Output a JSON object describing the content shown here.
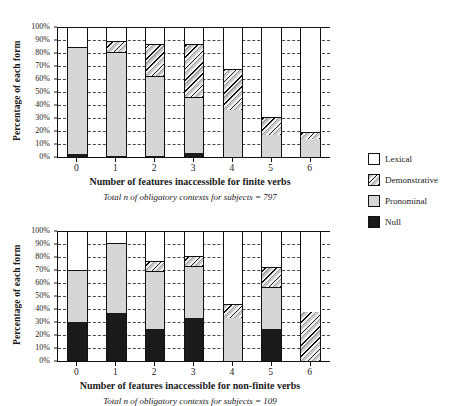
{
  "legend": {
    "items": [
      {
        "label": "Lexical",
        "key": "lexical",
        "color": "#ffffff"
      },
      {
        "label": "Demonstrative",
        "key": "demonstrative",
        "color": "#hatch"
      },
      {
        "label": "Pronominal",
        "key": "pronominal",
        "color": "#d6d6d6"
      },
      {
        "label": "Null",
        "key": "null",
        "color": "#1a1a1a"
      }
    ]
  },
  "chart_data": [
    {
      "id": "finite",
      "type": "bar",
      "stacked": true,
      "title": "",
      "xlabel": "Number of features inaccessible for finite verbs",
      "ylabel": "Percentage of each form",
      "caption_prefix": "Total ",
      "caption_n": "n",
      "caption_suffix": " of obligatory contexts for subjects = 797",
      "caption": "Total n of obligatory contexts for subjects = 797",
      "categories": [
        "0",
        "1",
        "2",
        "3",
        "4",
        "5",
        "6"
      ],
      "ylim": [
        0,
        100
      ],
      "yticks": [
        "0%",
        "10%",
        "20%",
        "30%",
        "40%",
        "50%",
        "60%",
        "70%",
        "80%",
        "90%",
        "100%"
      ],
      "grid": true,
      "legend_position": "right",
      "series": [
        {
          "name": "Null",
          "key": "null",
          "values": [
            2,
            1,
            1,
            3,
            0,
            0,
            0
          ]
        },
        {
          "name": "Pronominal",
          "key": "pronominal",
          "values": [
            83,
            80,
            61,
            43,
            36,
            17,
            14
          ]
        },
        {
          "name": "Demonstrative",
          "key": "demonstrative",
          "values": [
            0,
            8,
            25,
            41,
            32,
            14,
            5
          ]
        },
        {
          "name": "Lexical",
          "key": "lexical",
          "values": [
            15,
            11,
            13,
            13,
            32,
            69,
            81
          ]
        }
      ]
    },
    {
      "id": "nonfinite",
      "type": "bar",
      "stacked": true,
      "title": "",
      "xlabel": "Number of features inaccessible for non-finite verbs",
      "ylabel": "Percentage of each form",
      "caption_prefix": "Total ",
      "caption_n": "n",
      "caption_suffix": " of obligatory contexts for subjects = 109",
      "caption": "Total n of obligatory contexts for subjects = 109",
      "categories": [
        "0",
        "1",
        "2",
        "3",
        "4",
        "5",
        "6"
      ],
      "ylim": [
        0,
        100
      ],
      "yticks": [
        "0%",
        "10%",
        "20%",
        "30%",
        "40%",
        "50%",
        "60%",
        "70%",
        "80%",
        "90%",
        "100%"
      ],
      "grid": true,
      "legend_position": "right",
      "series": [
        {
          "name": "Null",
          "key": "null",
          "values": [
            30,
            37,
            25,
            33,
            0,
            25,
            0
          ]
        },
        {
          "name": "Pronominal",
          "key": "pronominal",
          "values": [
            40,
            54,
            44,
            40,
            33,
            32,
            0
          ]
        },
        {
          "name": "Demonstrative",
          "key": "demonstrative",
          "values": [
            0,
            0,
            8,
            8,
            11,
            15,
            38
          ]
        },
        {
          "name": "Lexical",
          "key": "lexical",
          "values": [
            30,
            9,
            23,
            19,
            56,
            28,
            62
          ]
        }
      ]
    }
  ]
}
